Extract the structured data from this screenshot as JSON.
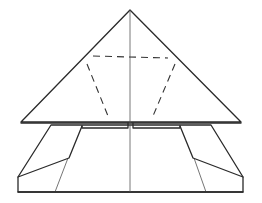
{
  "figure": {
    "elements": [
      "top-triangle-flap",
      "center-crease",
      "dashed-fold-guide",
      "lower-body",
      "left-side-flap",
      "right-side-flap"
    ],
    "colors": {
      "line": "#2a2a2a",
      "background": "#ffffff"
    }
  }
}
